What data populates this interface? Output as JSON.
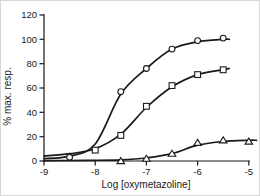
{
  "figure": {
    "background": "#ffffff",
    "ink_color": "#1a1a1a",
    "frame_color": "#d8d8d8"
  },
  "chart_data": {
    "type": "line",
    "title": "",
    "xlabel": "Log [oxymetazoline]",
    "ylabel": "% max. resp.",
    "xlim": [
      -9,
      -5
    ],
    "ylim": [
      0,
      120
    ],
    "x_ticks": [
      -9,
      -8,
      -7,
      -6,
      -5
    ],
    "x_tick_labels": [
      "-9",
      "-8",
      "-7",
      "-6",
      "-5"
    ],
    "y_ticks": [
      0,
      20,
      40,
      60,
      80,
      100,
      120
    ],
    "y_tick_labels": [
      "0",
      "20",
      "40",
      "60",
      "80",
      "100",
      "120"
    ],
    "grid": false,
    "legend_position": "none",
    "marker_fill": "#ffffff",
    "series": [
      {
        "name": "circle-series",
        "marker": "circle",
        "x": [
          -8.5,
          -7.5,
          -7,
          -6.5,
          -6,
          -5.5
        ],
        "y": [
          3,
          57,
          76,
          92,
          99,
          101
        ],
        "curve_x": [
          -9,
          -8.5,
          -8,
          -7.5,
          -7,
          -6.5,
          -6,
          -5.5,
          -5.38
        ],
        "curve_y": [
          2,
          4,
          14,
          55,
          76,
          92,
          98,
          100,
          100
        ]
      },
      {
        "name": "square-series",
        "marker": "square",
        "x": [
          -8,
          -7.5,
          -7,
          -6.5,
          -6,
          -5.5
        ],
        "y": [
          9,
          21,
          45,
          62,
          71,
          75
        ],
        "curve_x": [
          -9,
          -8.5,
          -8,
          -7.5,
          -7,
          -6.5,
          -6,
          -5.5,
          -5.38
        ],
        "curve_y": [
          4,
          6,
          10,
          22,
          44,
          61,
          71,
          75,
          76
        ]
      },
      {
        "name": "triangle-series",
        "marker": "triangle",
        "x": [
          -7.5,
          -7,
          -6.5,
          -6,
          -5.5,
          -5
        ],
        "y": [
          0,
          2,
          6,
          15,
          17,
          16
        ],
        "curve_x": [
          -9,
          -8.2,
          -7.5,
          -7,
          -6.5,
          -6,
          -5.5,
          -5,
          -4.85
        ],
        "curve_y": [
          0.3,
          0.5,
          1,
          2.5,
          6,
          13,
          16,
          17,
          17
        ]
      }
    ]
  }
}
